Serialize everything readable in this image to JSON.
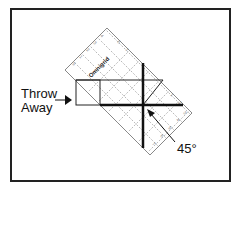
{
  "figure": {
    "labels": {
      "throw_line1": "Throw",
      "throw_line2": "Away",
      "angle": "45°"
    },
    "ruler": {
      "brand": "Omnigrid",
      "angle_deg": 45
    },
    "colors": {
      "stroke": "#111111",
      "ruler_grid": "#9a9a9a",
      "background": "#ffffff"
    }
  }
}
